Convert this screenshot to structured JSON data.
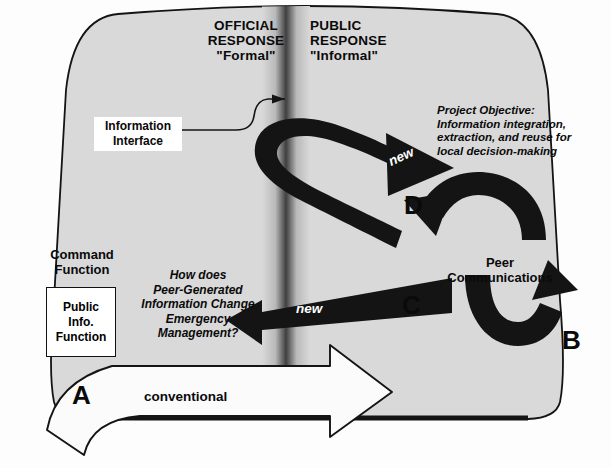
{
  "diagram": {
    "title_hidden": "Emergency response information flow diagram",
    "columns": {
      "left": {
        "line1": "OFFICIAL",
        "line2": "RESPONSE",
        "line3": "\"Formal\""
      },
      "right": {
        "line1": "PUBLIC",
        "line2": "RESPONSE",
        "line3": "\"Informal\""
      }
    },
    "callouts": {
      "information_interface": {
        "line1": "Information",
        "line2": "Interface"
      },
      "project_objective": {
        "heading": "Project Objective:",
        "line1": "Information integration,",
        "line2": "extraction, and reuse for",
        "line3": "local decision-making"
      },
      "research_question": {
        "line1": "How does",
        "line2": "Peer-Generated",
        "line3": "Information Change",
        "line4": "Emergency",
        "line5": "Management?"
      }
    },
    "nodes": {
      "command_function": {
        "line1": "Command",
        "line2": "Function"
      },
      "public_info_function": {
        "line1": "Public",
        "line2": "Info.",
        "line3": "Function"
      },
      "peer_communications": {
        "line1": "Peer",
        "line2": "Communications"
      }
    },
    "flows": [
      {
        "id": "A",
        "letter": "A",
        "label": "conventional",
        "style": "white-outline-arrow"
      },
      {
        "id": "B",
        "letter": "B",
        "label": "",
        "style": "black-cycle-arrow"
      },
      {
        "id": "C",
        "letter": "C",
        "label": "new",
        "style": "black-arrow"
      },
      {
        "id": "D",
        "letter": "D",
        "label": "new",
        "style": "black-loop-arrow"
      }
    ],
    "colors": {
      "ink": "#0a0a0a",
      "arrow_fill": "#111111",
      "panel_fill": "#d9d9d9",
      "divider_dark": "#4a4a4a",
      "white": "#ffffff"
    }
  }
}
